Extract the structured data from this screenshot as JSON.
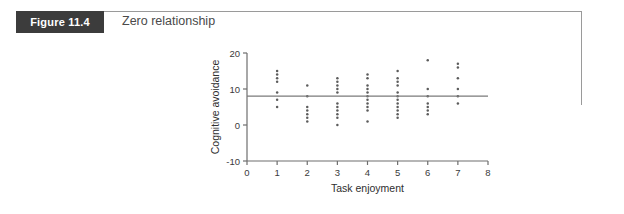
{
  "figure": {
    "badge_label": "Figure 11.4",
    "caption": "Zero relationship",
    "frame_color": "#9a9a9a",
    "badge_color": "#3c3c3c"
  },
  "chart_data": {
    "type": "scatter",
    "title": "Zero relationship",
    "xlabel": "Task enjoyment",
    "ylabel": "Cognitive avoidance",
    "xlim": [
      0,
      8
    ],
    "ylim": [
      -10,
      20
    ],
    "xticks": [
      0,
      1,
      2,
      3,
      4,
      5,
      6,
      7,
      8
    ],
    "xtick_labels": [
      "0",
      "1",
      "2",
      "3",
      "4",
      "5",
      "6",
      "7",
      "8"
    ],
    "yticks": [
      -10,
      0,
      10,
      20
    ],
    "ytick_labels": [
      "-10",
      "0",
      "10",
      "20"
    ],
    "grid": false,
    "legend": null,
    "point_color": "#5c5c5c",
    "line_color": "#7a7a7a",
    "trend_line": {
      "type": "horizontal",
      "y": 8,
      "x_start": 0,
      "x_end": 8,
      "description": "Flat regression line indicating no relationship"
    },
    "series": [
      {
        "name": "Observations",
        "points": [
          {
            "x": 1,
            "y": 15
          },
          {
            "x": 1,
            "y": 14
          },
          {
            "x": 1,
            "y": 13
          },
          {
            "x": 1,
            "y": 12
          },
          {
            "x": 1,
            "y": 9
          },
          {
            "x": 1,
            "y": 7
          },
          {
            "x": 1,
            "y": 5
          },
          {
            "x": 2,
            "y": 11
          },
          {
            "x": 2,
            "y": 8
          },
          {
            "x": 2,
            "y": 5
          },
          {
            "x": 2,
            "y": 4
          },
          {
            "x": 2,
            "y": 3
          },
          {
            "x": 2,
            "y": 2
          },
          {
            "x": 2,
            "y": 1
          },
          {
            "x": 3,
            "y": 13
          },
          {
            "x": 3,
            "y": 12
          },
          {
            "x": 3,
            "y": 11
          },
          {
            "x": 3,
            "y": 10
          },
          {
            "x": 3,
            "y": 9
          },
          {
            "x": 3,
            "y": 6
          },
          {
            "x": 3,
            "y": 5
          },
          {
            "x": 3,
            "y": 4
          },
          {
            "x": 3,
            "y": 3
          },
          {
            "x": 3,
            "y": 2
          },
          {
            "x": 3,
            "y": 0
          },
          {
            "x": 4,
            "y": 14
          },
          {
            "x": 4,
            "y": 13
          },
          {
            "x": 4,
            "y": 11
          },
          {
            "x": 4,
            "y": 10
          },
          {
            "x": 4,
            "y": 9
          },
          {
            "x": 4,
            "y": 8
          },
          {
            "x": 4,
            "y": 7
          },
          {
            "x": 4,
            "y": 6
          },
          {
            "x": 4,
            "y": 5
          },
          {
            "x": 4,
            "y": 4
          },
          {
            "x": 4,
            "y": 1
          },
          {
            "x": 5,
            "y": 15
          },
          {
            "x": 5,
            "y": 13
          },
          {
            "x": 5,
            "y": 12
          },
          {
            "x": 5,
            "y": 11
          },
          {
            "x": 5,
            "y": 9
          },
          {
            "x": 5,
            "y": 8
          },
          {
            "x": 5,
            "y": 7
          },
          {
            "x": 5,
            "y": 6
          },
          {
            "x": 5,
            "y": 5
          },
          {
            "x": 5,
            "y": 4
          },
          {
            "x": 5,
            "y": 3
          },
          {
            "x": 5,
            "y": 2
          },
          {
            "x": 6,
            "y": 18
          },
          {
            "x": 6,
            "y": 10
          },
          {
            "x": 6,
            "y": 8
          },
          {
            "x": 6,
            "y": 6
          },
          {
            "x": 6,
            "y": 5
          },
          {
            "x": 6,
            "y": 4
          },
          {
            "x": 6,
            "y": 3
          },
          {
            "x": 7,
            "y": 17
          },
          {
            "x": 7,
            "y": 16
          },
          {
            "x": 7,
            "y": 13
          },
          {
            "x": 7,
            "y": 10
          },
          {
            "x": 7,
            "y": 8
          },
          {
            "x": 7,
            "y": 6
          }
        ]
      }
    ]
  }
}
